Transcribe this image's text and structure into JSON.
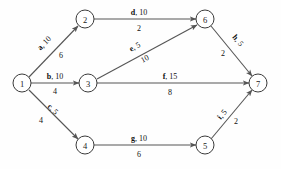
{
  "diagram": {
    "background_color": "#fefefe",
    "node_stroke_color": "#3a3a3a",
    "edge_color": "#555555",
    "text_color": "#101010",
    "nodes": [
      {
        "id": "1",
        "label": "1",
        "cx": 22,
        "cy": 83,
        "r": 9
      },
      {
        "id": "2",
        "label": "2",
        "cx": 85,
        "cy": 19,
        "r": 9
      },
      {
        "id": "3",
        "label": "3",
        "cx": 88,
        "cy": 83,
        "r": 9
      },
      {
        "id": "4",
        "label": "4",
        "cx": 85,
        "cy": 145,
        "r": 9
      },
      {
        "id": "5",
        "label": "5",
        "cx": 205,
        "cy": 145,
        "r": 9
      },
      {
        "id": "6",
        "label": "6",
        "cx": 205,
        "cy": 19,
        "r": 9
      },
      {
        "id": "7",
        "label": "7",
        "cx": 258,
        "cy": 83,
        "r": 9
      }
    ],
    "edges": [
      {
        "id": "a",
        "from": "1",
        "to": "2",
        "name": "a",
        "separator": ", ",
        "value": "10",
        "cost": "6",
        "x1": 29,
        "y1": 77,
        "x2": 78,
        "y2": 26,
        "name_x": 46,
        "name_y": 45,
        "name_rotate": -46,
        "cost_x": 61,
        "cost_y": 58,
        "cost_rotate": 0
      },
      {
        "id": "b",
        "from": "1",
        "to": "3",
        "name": "b",
        "separator": ", ",
        "value": "10",
        "cost": "4",
        "x1": 31,
        "y1": 83,
        "x2": 79,
        "y2": 83,
        "name_x": 55,
        "name_y": 79,
        "name_rotate": 0,
        "cost_x": 55,
        "cost_y": 94,
        "cost_rotate": 0
      },
      {
        "id": "c",
        "from": "1",
        "to": "4",
        "name": "c",
        "separator": ", ",
        "value": "5",
        "cost": "4",
        "x1": 29,
        "y1": 90,
        "x2": 78,
        "y2": 139,
        "name_x": 51,
        "name_y": 111,
        "name_rotate": 45,
        "cost_x": 41,
        "cost_y": 123,
        "cost_rotate": 0
      },
      {
        "id": "d",
        "from": "2",
        "to": "6",
        "name": "d",
        "separator": ", ",
        "value": "10",
        "cost": "2",
        "x1": 94,
        "y1": 19,
        "x2": 196,
        "y2": 19,
        "name_x": 139,
        "name_y": 15,
        "name_rotate": 0,
        "cost_x": 139,
        "cost_y": 31,
        "cost_rotate": 0
      },
      {
        "id": "e",
        "from": "3",
        "to": "6",
        "name": "e",
        "separator": ", ",
        "value": "5",
        "cost": "10",
        "x1": 97,
        "y1": 79,
        "x2": 197,
        "y2": 25,
        "name_x": 136,
        "name_y": 49,
        "name_rotate": -28,
        "cost_x": 146,
        "cost_y": 61,
        "cost_rotate": -28
      },
      {
        "id": "f",
        "from": "3",
        "to": "7",
        "name": "f",
        "separator": ", ",
        "value": "15",
        "cost": "8",
        "x1": 97,
        "y1": 83,
        "x2": 249,
        "y2": 83,
        "name_x": 170,
        "name_y": 79,
        "name_rotate": 0,
        "cost_x": 170,
        "cost_y": 95,
        "cost_rotate": 0
      },
      {
        "id": "g",
        "from": "4",
        "to": "5",
        "name": "g",
        "separator": ", ",
        "value": "10",
        "cost": "6",
        "x1": 94,
        "y1": 145,
        "x2": 196,
        "y2": 145,
        "name_x": 139,
        "name_y": 141,
        "name_rotate": 0,
        "cost_x": 139,
        "cost_y": 157,
        "cost_rotate": 0
      },
      {
        "id": "h",
        "from": "6",
        "to": "7",
        "name": "h",
        "separator": ", ",
        "value": "5",
        "cost": "2",
        "x1": 211,
        "y1": 26,
        "x2": 252,
        "y2": 76,
        "name_x": 236,
        "name_y": 42,
        "name_rotate": 50,
        "cost_x": 223,
        "cost_y": 56,
        "cost_rotate": 0
      },
      {
        "id": "i",
        "from": "5",
        "to": "7",
        "name": "i",
        "separator": ", ",
        "value": "5",
        "cost": "2",
        "x1": 211,
        "y1": 139,
        "x2": 252,
        "y2": 90,
        "name_x": 224,
        "name_y": 116,
        "name_rotate": -50,
        "cost_x": 236,
        "cost_y": 124,
        "cost_rotate": 0
      }
    ]
  }
}
